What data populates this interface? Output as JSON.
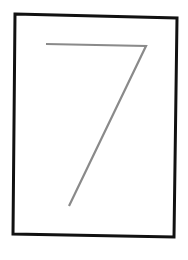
{
  "card": {
    "digit": "7",
    "frame_color": "#111111",
    "stroke_color": "#8a8a8a",
    "background": "#ffffff"
  }
}
